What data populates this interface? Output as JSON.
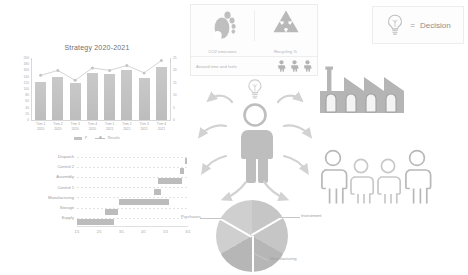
{
  "chart_data": [
    {
      "type": "bar",
      "title": "Strategy 2020-2021",
      "categories": [
        "Trim 1\n2020",
        "Trim 2\n2020",
        "Trim 3\n2020",
        "Trim 4\n2020",
        "Trim 1\n2021",
        "Trim 2\n2021",
        "Trim 3\n2021",
        "Trim 4\n2021"
      ],
      "series": [
        {
          "name": "P",
          "type": "bar",
          "values": [
            122,
            140,
            118,
            152,
            150,
            162,
            136,
            172
          ]
        },
        {
          "name": "Results",
          "type": "line",
          "values": [
            18,
            20,
            16,
            21,
            20,
            22,
            19,
            24
          ]
        }
      ],
      "xlabel": "",
      "ylabel": "",
      "ylim": [
        0,
        200
      ],
      "y2lim": [
        0,
        25
      ],
      "yticks": [
        "200",
        "180",
        "160",
        "140",
        "120",
        "100",
        "80",
        "60",
        "40",
        "20",
        "0"
      ],
      "y2ticks": [
        "25",
        "20",
        "15",
        "10",
        "5",
        "0"
      ],
      "legend": [
        "P",
        "Results"
      ],
      "legend_position": "bottom",
      "grid": false
    },
    {
      "type": "bar",
      "orientation": "horizontal",
      "subtype": "gantt",
      "title": "",
      "categories": [
        "Dispatch",
        "Control 2",
        "Assembly",
        "Control 1",
        "Manufacturing",
        "Storage",
        "Supply"
      ],
      "bars": [
        {
          "label": "Dispatch",
          "start": 97,
          "length": 2
        },
        {
          "label": "Control 2",
          "start": 93,
          "length": 3
        },
        {
          "label": "Assembly",
          "start": 73,
          "length": 22
        },
        {
          "label": "Control 1",
          "start": 69,
          "length": 7
        },
        {
          "label": "Manufacturing",
          "start": 38,
          "length": 45
        },
        {
          "label": "Storage",
          "start": 25,
          "length": 12
        },
        {
          "label": "Supply",
          "start": 0,
          "length": 33
        }
      ],
      "xticks": [
        "1/1",
        "2/1",
        "3/1",
        "4/1",
        "5/1",
        "6/1"
      ],
      "grid": false
    },
    {
      "type": "pie",
      "title": "",
      "labels": [
        "Investment",
        "Manufacturing",
        "Purchases"
      ],
      "values": [
        33.3,
        33.3,
        33.4
      ],
      "legend_position": "callouts"
    }
  ],
  "bar_chart": {
    "title": "Strategy 2020-2021",
    "legend": [
      {
        "key": "bar",
        "label": "P"
      },
      {
        "key": "line",
        "label": "Results"
      }
    ]
  },
  "kpi_panel": {
    "cells": [
      {
        "icon": "footprint-icon",
        "label": "CO2 emissions"
      },
      {
        "icon": "recycling-icon",
        "label": "Recycling %"
      }
    ],
    "bottom": {
      "label": "Around time and fuels",
      "icon": "person-icon",
      "icon_count": 3
    }
  },
  "decision_legend": {
    "icon": "lightbulb-icon",
    "equals": "=",
    "label": "Decision"
  },
  "center": {
    "person_icon": "person-icon",
    "idea_icon": "lightbulb-icon"
  },
  "factory": {
    "icon": "factory-icon"
  },
  "people_group": {
    "icon": "people-group-icon",
    "count": 4
  },
  "colors": {
    "bar": "#c2c2c2",
    "line": "#c8c8c8",
    "gantt_bar": "#bcbcbc",
    "icon": "#bdbdbd",
    "text": "#9a9a9a",
    "panel_border": "#ececec",
    "background": "#ffffff"
  }
}
